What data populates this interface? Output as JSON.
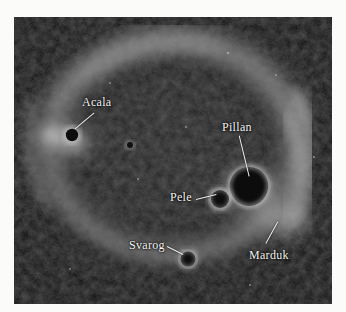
{
  "figure": {
    "kind": "astronomical-image",
    "background_color": "#050505",
    "border_color": "#ffffff",
    "label_color": "#f4f4f2",
    "leader_color": "#f2f2ef",
    "plate": {
      "x": 14,
      "y": 17,
      "width": 318,
      "height": 287
    }
  },
  "annotations": [
    {
      "name": "Acala",
      "label": "Acala",
      "label_x": 82,
      "label_y": 96,
      "leader": {
        "x1": 94,
        "y1": 112,
        "x2": 75,
        "y2": 128
      },
      "target_x": 72,
      "target_y": 132
    },
    {
      "name": "Pillan",
      "label": "Pillan",
      "label_x": 222,
      "label_y": 121,
      "leader": {
        "x1": 239,
        "y1": 135,
        "x2": 249,
        "y2": 176
      },
      "target_x": 249,
      "target_y": 184
    },
    {
      "name": "Pele",
      "label": "Pele",
      "label_x": 170,
      "label_y": 191,
      "leader": {
        "x1": 196,
        "y1": 199,
        "x2": 216,
        "y2": 194
      },
      "target_x": 219,
      "target_y": 199
    },
    {
      "name": "Marduk",
      "label": "Marduk",
      "label_x": 249,
      "label_y": 249,
      "leader": {
        "x1": 266,
        "y1": 243,
        "x2": 278,
        "y2": 221
      },
      "target_x": 280,
      "target_y": 215
    },
    {
      "name": "Svarog",
      "label": "Svarog",
      "label_x": 129,
      "label_y": 239,
      "leader": {
        "x1": 167,
        "y1": 246,
        "x2": 183,
        "y2": 254
      },
      "target_x": 186,
      "target_y": 258
    }
  ],
  "features": {
    "bright_arc": "diffuse glowing limb ring around the disk",
    "dark_spots": [
      "Acala",
      "Pillan",
      "Pele",
      "Svarog"
    ],
    "bright_spots": [
      "Marduk"
    ]
  }
}
